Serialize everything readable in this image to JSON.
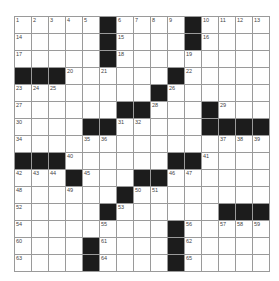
{
  "puzzle": {
    "rows": 15,
    "cols": 15,
    "colors": {
      "block": "#1c1c1c",
      "line": "#9a9a9a",
      "cell": "#ffffff"
    },
    "grid": [
      "11111#1111#1111",
      "11111#1111#1111",
      "11111#11111111",
      "###111111#11111",
      "11111111#111111",
      "111111##111#111",
      "1111##11111####",
      "111111111111111",
      "###111111##1111",
      "111#111##111111",
      "111111#11111111",
      "11111#111111###",
      "111111111#11111",
      "1111#1111#11111",
      "1111#1111#11111"
    ],
    "numbers": [
      {
        "r": 0,
        "c": 0,
        "n": "1"
      },
      {
        "r": 0,
        "c": 1,
        "n": "2"
      },
      {
        "r": 0,
        "c": 2,
        "n": "3"
      },
      {
        "r": 0,
        "c": 3,
        "n": "4"
      },
      {
        "r": 0,
        "c": 4,
        "n": "5"
      },
      {
        "r": 0,
        "c": 6,
        "n": "6"
      },
      {
        "r": 0,
        "c": 7,
        "n": "7"
      },
      {
        "r": 0,
        "c": 8,
        "n": "8"
      },
      {
        "r": 0,
        "c": 9,
        "n": "9"
      },
      {
        "r": 0,
        "c": 11,
        "n": "10"
      },
      {
        "r": 0,
        "c": 12,
        "n": "11"
      },
      {
        "r": 0,
        "c": 13,
        "n": "12"
      },
      {
        "r": 0,
        "c": 14,
        "n": "13"
      },
      {
        "r": 1,
        "c": 0,
        "n": "14"
      },
      {
        "r": 1,
        "c": 6,
        "n": "15"
      },
      {
        "r": 1,
        "c": 11,
        "n": "16"
      },
      {
        "r": 2,
        "c": 0,
        "n": "17"
      },
      {
        "r": 2,
        "c": 6,
        "n": "18"
      },
      {
        "r": 2,
        "c": 10,
        "n": "19"
      },
      {
        "r": 3,
        "c": 3,
        "n": "20"
      },
      {
        "r": 3,
        "c": 5,
        "n": "21"
      },
      {
        "r": 3,
        "c": 10,
        "n": "22"
      },
      {
        "r": 4,
        "c": 0,
        "n": "23"
      },
      {
        "r": 4,
        "c": 1,
        "n": "24"
      },
      {
        "r": 4,
        "c": 2,
        "n": "25"
      },
      {
        "r": 4,
        "c": 9,
        "n": "26"
      },
      {
        "r": 5,
        "c": 0,
        "n": "27"
      },
      {
        "r": 5,
        "c": 8,
        "n": "28"
      },
      {
        "r": 5,
        "c": 12,
        "n": "29"
      },
      {
        "r": 6,
        "c": 0,
        "n": "30"
      },
      {
        "r": 6,
        "c": 6,
        "n": "31"
      },
      {
        "r": 6,
        "c": 7,
        "n": "32"
      },
      {
        "r": 6,
        "c": 11,
        "n": "33"
      },
      {
        "r": 7,
        "c": 0,
        "n": "34"
      },
      {
        "r": 7,
        "c": 4,
        "n": "35"
      },
      {
        "r": 7,
        "c": 5,
        "n": "36"
      },
      {
        "r": 7,
        "c": 12,
        "n": "37"
      },
      {
        "r": 7,
        "c": 13,
        "n": "38"
      },
      {
        "r": 7,
        "c": 14,
        "n": "39"
      },
      {
        "r": 8,
        "c": 3,
        "n": "40"
      },
      {
        "r": 8,
        "c": 11,
        "n": "41"
      },
      {
        "r": 9,
        "c": 0,
        "n": "42"
      },
      {
        "r": 9,
        "c": 1,
        "n": "43"
      },
      {
        "r": 9,
        "c": 2,
        "n": "44"
      },
      {
        "r": 9,
        "c": 4,
        "n": "45"
      },
      {
        "r": 9,
        "c": 9,
        "n": "46"
      },
      {
        "r": 9,
        "c": 10,
        "n": "47"
      },
      {
        "r": 10,
        "c": 0,
        "n": "48"
      },
      {
        "r": 10,
        "c": 3,
        "n": "49"
      },
      {
        "r": 10,
        "c": 7,
        "n": "50"
      },
      {
        "r": 10,
        "c": 8,
        "n": "51"
      },
      {
        "r": 11,
        "c": 0,
        "n": "52"
      },
      {
        "r": 11,
        "c": 6,
        "n": "53"
      },
      {
        "r": 12,
        "c": 0,
        "n": "54"
      },
      {
        "r": 12,
        "c": 5,
        "n": "55"
      },
      {
        "r": 12,
        "c": 10,
        "n": "56"
      },
      {
        "r": 12,
        "c": 12,
        "n": "57"
      },
      {
        "r": 12,
        "c": 13,
        "n": "58"
      },
      {
        "r": 12,
        "c": 14,
        "n": "59"
      },
      {
        "r": 13,
        "c": 0,
        "n": "60"
      },
      {
        "r": 13,
        "c": 5,
        "n": "61"
      },
      {
        "r": 13,
        "c": 10,
        "n": "62"
      },
      {
        "r": 14,
        "c": 0,
        "n": "63"
      },
      {
        "r": 14,
        "c": 5,
        "n": "64"
      },
      {
        "r": 14,
        "c": 10,
        "n": "65"
      }
    ]
  }
}
